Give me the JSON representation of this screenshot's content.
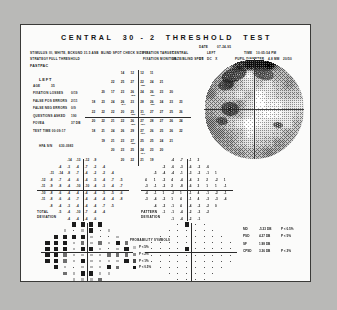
{
  "report": {
    "title": "CENTRAL  30 - 2  THRESHOLD  TEST",
    "date_label": "DATE",
    "date_value": "07-24-95",
    "stimulus_label": "STIMULUS",
    "stimulus_value": "III, WHITE, BCKGND 31.5 ASB  BLIND SPOT CHECK SIZE III",
    "strategy_label": "STRATEGY",
    "strategy_value": "FULL THRESHOLD",
    "mode": "FASTPAC",
    "fixation_target_label": "FIXATION TARGET",
    "fixation_target_value": "CENTRAL",
    "fixation_monitor_label": "FIXATION MONITOR",
    "fixation_monitor_value": "GAZE/BLIND SPOT",
    "time_label": "TIME",
    "time_value": "10:05:54 PM",
    "eye_label": "EYE",
    "eye_value": "LEFT",
    "pupil_diameter_label": "PUPIL DIAMETER",
    "pupil_diameter_value": "4.8 MM",
    "va_label": "VA",
    "va_value": "20/50",
    "rx_label": "RX",
    "rx_value": "DS   DC   X"
  },
  "parameters": {
    "eye": "LEFT",
    "age_label": "AGE",
    "age_value": "35",
    "rows": [
      {
        "label": "FIXATION LOSSES",
        "value": "0/19"
      },
      {
        "label": "FALSE POS ERRORS",
        "value": "2/11"
      },
      {
        "label": "FALSE NEG ERRORS",
        "value": "0/9"
      },
      {
        "label": "QUESTIONS ASKED",
        "value": "190"
      },
      {
        "label": "FOVEA",
        "value": "37 DB"
      },
      {
        "label": "TEST TIME 00:09:17",
        "value": ""
      }
    ],
    "serial_label": "HFA S/N",
    "serial_value": "630-0983"
  },
  "threshold": {
    "caption": "",
    "rows": [
      {
        "y": 27,
        "values": [
          "14",
          "12",
          "12",
          "11"
        ]
      },
      {
        "y": 21,
        "values": [
          "22",
          "25",
          "27",
          "22",
          "24",
          "21"
        ]
      },
      {
        "y": 15,
        "values": [
          "20",
          "17",
          "23",
          "26",
          "24",
          "26",
          "23",
          "20"
        ]
      },
      {
        "y": 9,
        "values": [
          "18",
          "23",
          "24",
          "26",
          "23",
          "28",
          "26",
          "24",
          "23",
          "23"
        ]
      },
      {
        "y": 3,
        "values": [
          "22",
          "22",
          "22",
          "20",
          "25",
          "31",
          "27",
          "27",
          "25",
          "26"
        ]
      },
      {
        "y": -3,
        "values": [
          "20",
          "22",
          "21",
          "22",
          "26",
          "27",
          "28",
          "27",
          "26",
          "24"
        ]
      },
      {
        "y": -9,
        "values": [
          "18",
          "21",
          "24",
          "26",
          "29",
          "27",
          "26",
          "25",
          "26",
          "22"
        ]
      },
      {
        "y": -15,
        "values": [
          "19",
          "21",
          "23",
          "27",
          "25",
          "25",
          "24",
          "21"
        ]
      },
      {
        "y": -21,
        "values": [
          "20",
          "23",
          "25",
          "24",
          "23",
          "20"
        ]
      },
      {
        "y": -27,
        "values": [
          "20",
          "22",
          "21",
          "19"
        ]
      }
    ],
    "repeats": [
      {
        "x": 3,
        "y": 21,
        "value": "25"
      },
      {
        "x": -3,
        "y": 15,
        "value": "23"
      },
      {
        "x": 9,
        "y": 15,
        "value": "26"
      },
      {
        "x": -9,
        "y": 9,
        "value": "24"
      },
      {
        "x": 9,
        "y": 9,
        "value": "26"
      },
      {
        "x": -3,
        "y": 3,
        "value": "25"
      },
      {
        "x": 3,
        "y": 3,
        "value": "31"
      },
      {
        "x": -3,
        "y": -3,
        "value": "26"
      },
      {
        "x": 3,
        "y": -3,
        "value": "27"
      },
      {
        "x": 3,
        "y": -9,
        "value": "27"
      },
      {
        "x": -3,
        "y": -15,
        "value": "25"
      },
      {
        "x": 3,
        "y": -21,
        "value": "24"
      }
    ]
  },
  "total_deviation": {
    "caption_line1": "TOTAL",
    "caption_line2": "DEVIATION",
    "rows": [
      {
        "y": 27,
        "values": [
          "-14",
          "-13",
          "-12",
          "-9"
        ]
      },
      {
        "y": 21,
        "values": [
          "-4",
          "-3",
          "-4",
          "-7",
          "-2",
          "-4"
        ]
      },
      {
        "y": 15,
        "values": [
          "-11",
          "-14",
          "-8",
          "-7",
          "-4",
          "-2",
          "-2",
          "-4"
        ]
      },
      {
        "y": 9,
        "values": [
          "-12",
          "-8",
          "-7",
          "-4",
          "-6",
          "-4",
          "-5",
          "-4",
          "-7",
          "-5"
        ]
      },
      {
        "y": 3,
        "values": [
          "-11",
          "-9",
          "-8",
          "-4",
          "-10",
          "-10",
          "-4",
          "-3",
          "-4",
          "-7"
        ]
      },
      {
        "y": -3,
        "values": [
          "-10",
          "-8",
          "-6",
          "-4",
          "-4",
          "-4",
          "-4",
          "-5",
          "-5",
          "-6"
        ]
      },
      {
        "y": -9,
        "values": [
          "-11",
          "-8",
          "-6",
          "-4",
          "-7",
          "-4",
          "-4",
          "-4",
          "-4",
          "-8"
        ]
      },
      {
        "y": -15,
        "values": [
          "-8",
          "-4",
          "-3",
          "-4",
          "-4",
          "-4",
          "-7",
          "-5"
        ]
      },
      {
        "y": -21,
        "values": [
          "-5",
          "-4",
          "-10",
          "-7",
          "-4",
          "-4"
        ]
      },
      {
        "y": -27,
        "values": [
          "-4",
          "-4",
          "-4",
          "-6"
        ]
      }
    ]
  },
  "pattern_deviation": {
    "caption_line1": "PATTERN",
    "caption_line2": "DEVIATION",
    "rows": [
      {
        "y": 27,
        "values": [
          "-4",
          "-7",
          "-1",
          "2"
        ]
      },
      {
        "y": 21,
        "values": [
          "-2",
          "-6",
          "-3",
          "-6",
          "-2",
          "-6"
        ]
      },
      {
        "y": 15,
        "values": [
          "-5",
          "-4",
          "-4",
          "-1",
          "-3",
          "-2",
          "-1",
          "1"
        ]
      },
      {
        "y": 9,
        "values": [
          "4",
          "1",
          "-2",
          "4",
          "-4",
          "-4",
          "2",
          "2",
          "-2",
          "1"
        ]
      },
      {
        "y": 3,
        "values": [
          "-3",
          "-1",
          "-2",
          "2",
          "-8",
          "-6",
          "2",
          "1",
          "1",
          "-1"
        ]
      },
      {
        "y": -3,
        "values": [
          "-4",
          "-1",
          "1",
          "-2",
          "1",
          "-1",
          "4",
          "-1",
          "-2",
          "-1"
        ]
      },
      {
        "y": -9,
        "values": [
          "-3",
          "-4",
          "-2",
          "1",
          "4",
          "-1",
          "4",
          "-3",
          "-3",
          "-4"
        ]
      },
      {
        "y": -15,
        "values": [
          "-4",
          "-2",
          "-1",
          "4",
          "-4",
          "-2",
          "-2",
          "0"
        ]
      },
      {
        "y": -21,
        "values": [
          "-1",
          "-1",
          "-4",
          "-2",
          "-3",
          "-2"
        ]
      },
      {
        "y": -27,
        "values": [
          "-1",
          "-4",
          "-2",
          "-1"
        ]
      }
    ]
  },
  "probability_legend": {
    "title": "PROBABILITY SYMBOLS",
    "items": [
      {
        "symbol": "light",
        "label": "P < 5%"
      },
      {
        "symbol": "mid",
        "label": "P < 2%"
      },
      {
        "symbol": "dark",
        "label": "P < 1%"
      },
      {
        "symbol": "black",
        "label": "P < 0.5%"
      }
    ]
  },
  "indices": {
    "rows": [
      {
        "name": "MD",
        "value": "-5.33 DB",
        "prob": "P < 0.5%"
      },
      {
        "name": "PSD",
        "value": "4.27 DB",
        "prob": "P < 5%"
      },
      {
        "name": "SF",
        "value": "1.98 DB",
        "prob": ""
      },
      {
        "name": "CPSD",
        "value": "3.36 DB",
        "prob": "P < 2%"
      }
    ]
  },
  "colors": {
    "ink": "#1a1a1a",
    "paper": "#fbfbfa",
    "border": "#3a3a38",
    "axis": "#2b2b2b",
    "defect": "#1c1c1c"
  }
}
